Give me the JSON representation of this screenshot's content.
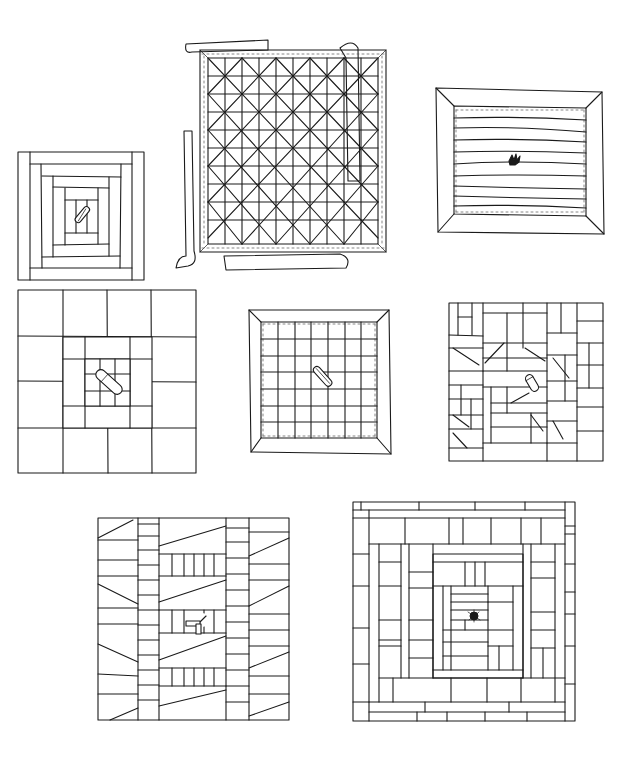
{
  "page": {
    "background": "#ffffff",
    "ink_color": "#1a1a1a"
  },
  "blocks": [
    {
      "id": "log-cabin-pinned",
      "label": "Log cabin block with safety pin",
      "box": [
        18,
        152,
        128,
        130
      ],
      "rings": 4,
      "center_marker": "safety-pin"
    },
    {
      "id": "quilted-grid-binding",
      "label": "Diagonal grid quilted block with binding strips",
      "box": [
        200,
        50,
        186,
        190
      ],
      "grid": 8,
      "diagonals": true,
      "binding_strips": 4
    },
    {
      "id": "horizontal-lines-mitered",
      "label": "Horizontal quilted lines with mitered border and tie tuft",
      "box": [
        436,
        88,
        178,
        145
      ],
      "lines": 10,
      "center_marker": "tuft"
    },
    {
      "id": "four-by-four-pinned",
      "label": "Four-by-four grid with concentric centre and safety pin",
      "box": [
        18,
        290,
        178,
        183
      ],
      "grid": 4,
      "center_marker": "safety-pin"
    },
    {
      "id": "grid-mitered-pinned",
      "label": "Grid quilted block with mitered border and safety pin",
      "box": [
        249,
        310,
        142,
        142
      ],
      "grid": 7,
      "center_marker": "safety-pin"
    },
    {
      "id": "crazy-strip-pinned",
      "label": "Crazy strip-pieced block with safety pin",
      "box": [
        449,
        303,
        154,
        157
      ],
      "center_marker": "safety-pin"
    },
    {
      "id": "rail-fence-ribbon",
      "label": "Strip block with ladder columns and ribbon",
      "box": [
        98,
        518,
        192,
        203
      ],
      "center_marker": "ribbon"
    },
    {
      "id": "courthouse-steps-tuft",
      "label": "Improvised log cabin with tie tuft",
      "box": [
        353,
        502,
        222,
        219
      ],
      "center_marker": "tuft"
    }
  ]
}
